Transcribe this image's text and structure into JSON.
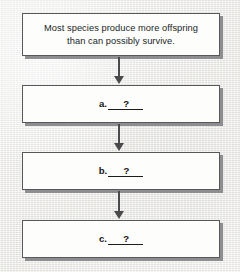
{
  "diagram": {
    "type": "vertical-flowchart",
    "background_color": "#edecea",
    "box_fill_color": "#fdfdfc",
    "box_border_color": "#58585a",
    "shadow_color": "#8e8e90",
    "arrow_color": "#4a4a4c",
    "nodes": [
      {
        "id": "premise",
        "name": "statement-box",
        "text": "Most species produce more offspring\nthan can possibly survive."
      },
      {
        "id": "step-a",
        "name": "blank-box-a",
        "letter": "a.",
        "blank": "?"
      },
      {
        "id": "step-b",
        "name": "blank-box-b",
        "letter": "b.",
        "blank": "?"
      },
      {
        "id": "step-c",
        "name": "blank-box-c",
        "letter": "c.",
        "blank": "?"
      }
    ],
    "connectors": [
      {
        "id": "arrow-1",
        "from": "premise",
        "to": "step-a",
        "direction": "down"
      },
      {
        "id": "arrow-2",
        "from": "step-a",
        "to": "step-b",
        "direction": "down"
      },
      {
        "id": "arrow-3",
        "from": "step-b",
        "to": "step-c",
        "direction": "down"
      }
    ]
  }
}
